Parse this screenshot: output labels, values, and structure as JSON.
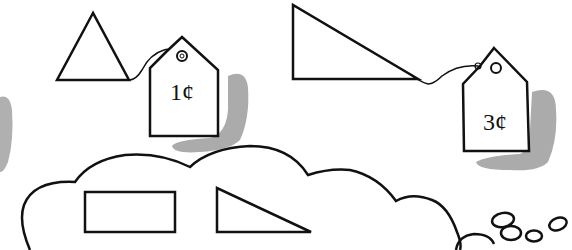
{
  "scene": {
    "description": "Price-tagged shapes with a thought cloud",
    "colors": {
      "ink": "#111111",
      "shadow": "#a9a9a9",
      "background": "#ffffff"
    }
  },
  "items": [
    {
      "shape": "equilateral-triangle",
      "price_tag": "1¢"
    },
    {
      "shape": "right-triangle",
      "price_tag": "3¢"
    }
  ],
  "thought_cloud": {
    "contents": [
      "rectangle",
      "right-triangle"
    ]
  }
}
